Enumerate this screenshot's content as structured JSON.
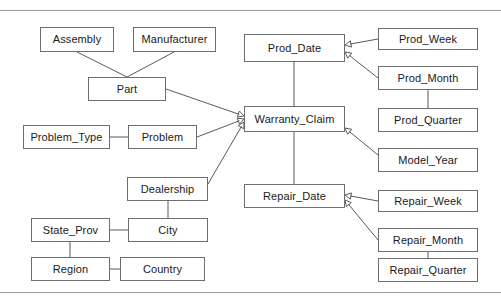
{
  "diagram": {
    "type": "entity-relationship",
    "background_color": "#ffffff",
    "box_border_color": "#6e6e6e",
    "line_color": "#595959",
    "rule_color": "#9a9a9a",
    "text_color": "#1a1a1a",
    "rules": [
      {
        "name": "top-rule",
        "y": 10
      },
      {
        "name": "bottom-rule",
        "y": 292
      }
    ],
    "nodes": [
      {
        "id": "assembly",
        "label": "Assembly",
        "x": 40,
        "y": 27,
        "w": 74,
        "h": 25
      },
      {
        "id": "manufacturer",
        "label": "Manufacturer",
        "x": 133,
        "y": 27,
        "w": 83,
        "h": 25
      },
      {
        "id": "part",
        "label": "Part",
        "x": 88,
        "y": 77,
        "w": 78,
        "h": 24
      },
      {
        "id": "problem_type",
        "label": "Problem_Type",
        "x": 23,
        "y": 125,
        "w": 87,
        "h": 24
      },
      {
        "id": "problem",
        "label": "Problem",
        "x": 128,
        "y": 125,
        "w": 69,
        "h": 24
      },
      {
        "id": "dealership",
        "label": "Dealership",
        "x": 127,
        "y": 177,
        "w": 81,
        "h": 24
      },
      {
        "id": "state_prov",
        "label": "State_Prov",
        "x": 31,
        "y": 218,
        "w": 79,
        "h": 24
      },
      {
        "id": "city",
        "label": "City",
        "x": 128,
        "y": 218,
        "w": 80,
        "h": 24
      },
      {
        "id": "region",
        "label": "Region",
        "x": 31,
        "y": 257,
        "w": 79,
        "h": 24
      },
      {
        "id": "country",
        "label": "Country",
        "x": 120,
        "y": 257,
        "w": 85,
        "h": 24
      },
      {
        "id": "prod_date",
        "label": "Prod_Date",
        "x": 244,
        "y": 34,
        "w": 101,
        "h": 28
      },
      {
        "id": "warranty_claim",
        "label": "Warranty_Claim",
        "x": 244,
        "y": 106,
        "w": 101,
        "h": 26
      },
      {
        "id": "repair_date",
        "label": "Repair_Date",
        "x": 244,
        "y": 184,
        "w": 101,
        "h": 24
      },
      {
        "id": "prod_week",
        "label": "Prod_Week",
        "x": 378,
        "y": 28,
        "w": 100,
        "h": 22
      },
      {
        "id": "prod_month",
        "label": "Prod_Month",
        "x": 378,
        "y": 66,
        "w": 100,
        "h": 24
      },
      {
        "id": "prod_quarter",
        "label": "Prod_Quarter",
        "x": 378,
        "y": 108,
        "w": 100,
        "h": 24
      },
      {
        "id": "model_year",
        "label": "Model_Year",
        "x": 378,
        "y": 148,
        "w": 100,
        "h": 24
      },
      {
        "id": "repair_week",
        "label": "Repair_Week",
        "x": 378,
        "y": 190,
        "w": 100,
        "h": 22
      },
      {
        "id": "repair_month",
        "label": "Repair_Month",
        "x": 378,
        "y": 228,
        "w": 100,
        "h": 24
      },
      {
        "id": "repair_quarter",
        "label": "Repair_Quarter",
        "x": 378,
        "y": 258,
        "w": 100,
        "h": 24
      }
    ],
    "edges": [
      {
        "from": "assembly",
        "to": "part",
        "x1": 77,
        "y1": 52,
        "x2": 127,
        "y2": 77,
        "arrow": false
      },
      {
        "from": "manufacturer",
        "to": "part",
        "x1": 174,
        "y1": 52,
        "x2": 127,
        "y2": 77,
        "arrow": false
      },
      {
        "from": "part",
        "to": "warranty_claim",
        "x1": 166,
        "y1": 89,
        "x2": 244,
        "y2": 116,
        "arrow": true
      },
      {
        "from": "problem_type",
        "to": "problem",
        "x1": 110,
        "y1": 137,
        "x2": 128,
        "y2": 137,
        "arrow": false
      },
      {
        "from": "problem",
        "to": "warranty_claim",
        "x1": 197,
        "y1": 137,
        "x2": 244,
        "y2": 119,
        "arrow": true
      },
      {
        "from": "dealership",
        "to": "warranty_claim",
        "x1": 208,
        "y1": 184,
        "x2": 244,
        "y2": 122,
        "arrow": true
      },
      {
        "from": "dealership",
        "to": "city",
        "x1": 168,
        "y1": 201,
        "x2": 168,
        "y2": 218,
        "arrow": false
      },
      {
        "from": "state_prov",
        "to": "city",
        "x1": 110,
        "y1": 230,
        "x2": 128,
        "y2": 230,
        "arrow": false
      },
      {
        "from": "state_prov",
        "to": "region",
        "x1": 70,
        "y1": 242,
        "x2": 70,
        "y2": 257,
        "arrow": false
      },
      {
        "from": "region",
        "to": "country",
        "x1": 110,
        "y1": 269,
        "x2": 120,
        "y2": 269,
        "arrow": false
      },
      {
        "from": "prod_date",
        "to": "warranty_claim",
        "x1": 294,
        "y1": 62,
        "x2": 294,
        "y2": 106,
        "arrow": false
      },
      {
        "from": "prod_week",
        "to": "prod_date",
        "x1": 378,
        "y1": 39,
        "x2": 345,
        "y2": 45,
        "arrow": true
      },
      {
        "from": "prod_month",
        "to": "prod_date",
        "x1": 378,
        "y1": 78,
        "x2": 345,
        "y2": 52,
        "arrow": true
      },
      {
        "from": "prod_month",
        "to": "prod_quarter",
        "x1": 428,
        "y1": 90,
        "x2": 428,
        "y2": 108,
        "arrow": false
      },
      {
        "from": "model_year",
        "to": "warranty_claim",
        "x1": 378,
        "y1": 155,
        "x2": 345,
        "y2": 128,
        "arrow": true
      },
      {
        "from": "warranty_claim",
        "to": "repair_date",
        "x1": 294,
        "y1": 132,
        "x2": 294,
        "y2": 184,
        "arrow": false
      },
      {
        "from": "repair_week",
        "to": "repair_date",
        "x1": 378,
        "y1": 201,
        "x2": 345,
        "y2": 195,
        "arrow": true
      },
      {
        "from": "repair_month",
        "to": "repair_date",
        "x1": 378,
        "y1": 240,
        "x2": 345,
        "y2": 200,
        "arrow": true
      },
      {
        "from": "repair_month",
        "to": "repair_quarter",
        "x1": 428,
        "y1": 252,
        "x2": 428,
        "y2": 258,
        "arrow": false
      }
    ]
  }
}
